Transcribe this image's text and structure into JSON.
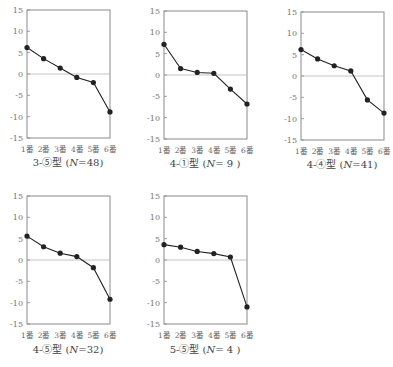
{
  "chart_data": [
    {
      "type": "line",
      "title": "3-⑤型 (N=48)",
      "categories": [
        "1番",
        "2番",
        "3番",
        "4番",
        "5番",
        "6番"
      ],
      "values": [
        6.2,
        3.6,
        1.4,
        -0.8,
        -2.0,
        -8.9
      ],
      "yticks": [
        15,
        10,
        5,
        0,
        -5,
        -10,
        -15
      ],
      "ylim": [
        -15,
        15
      ],
      "zero_line": true,
      "grid": false,
      "legend": null
    },
    {
      "type": "line",
      "title": "4-①型 (N=9)",
      "categories": [
        "1番",
        "2番",
        "3番",
        "4番",
        "5番",
        "6番"
      ],
      "values": [
        7.2,
        1.5,
        0.6,
        0.4,
        -3.3,
        -6.8
      ],
      "yticks": [
        15,
        10,
        5,
        0,
        -5,
        -10,
        -15
      ],
      "ylim": [
        -15,
        15
      ],
      "zero_line": true,
      "grid": false,
      "legend": null
    },
    {
      "type": "line",
      "title": "4-④型 (N=41)",
      "categories": [
        "1番",
        "2番",
        "3番",
        "4番",
        "5番",
        "6番"
      ],
      "values": [
        6.2,
        4.0,
        2.4,
        1.2,
        -5.6,
        -8.7
      ],
      "yticks": [
        15,
        10,
        5,
        0,
        -5,
        -10,
        -15
      ],
      "ylim": [
        -15,
        15
      ],
      "zero_line": true,
      "grid": false,
      "legend": null
    },
    {
      "type": "line",
      "title": "4-⑤型 (N=32)",
      "categories": [
        "1番",
        "2番",
        "3番",
        "4番",
        "5番",
        "6番"
      ],
      "values": [
        5.6,
        3.1,
        1.6,
        0.8,
        -1.8,
        -9.2
      ],
      "yticks": [
        15,
        10,
        5,
        0,
        -5,
        -10,
        -15
      ],
      "ylim": [
        -15,
        15
      ],
      "zero_line": true,
      "grid": false,
      "legend": null
    },
    {
      "type": "line",
      "title": "5-⑤型 (N=4)",
      "categories": [
        "1番",
        "2番",
        "3番",
        "4番",
        "5番",
        "6番"
      ],
      "values": [
        3.6,
        3.0,
        2.0,
        1.5,
        0.7,
        -11.0
      ],
      "yticks": [
        15,
        10,
        5,
        0,
        -5,
        -10,
        -15
      ],
      "ylim": [
        -15,
        15
      ],
      "zero_line": true,
      "grid": false,
      "legend": null
    }
  ],
  "captions": [
    {
      "prefix": "3-⑤型 (",
      "n": "N",
      "suffix": "=48)"
    },
    {
      "prefix": "4-①型 (",
      "n": "N",
      "suffix": "= 9 )"
    },
    {
      "prefix": "4-④型 (",
      "n": "N",
      "suffix": "=41)"
    },
    {
      "prefix": "4-⑤型 (",
      "n": "N",
      "suffix": "=32)"
    },
    {
      "prefix": "5-⑤型 (",
      "n": "N",
      "suffix": "= 4 )"
    }
  ],
  "colors": {
    "frame": "#8a8a8a",
    "zero_line": "#b5b5b5",
    "series": "#222222",
    "text": "#555555"
  }
}
